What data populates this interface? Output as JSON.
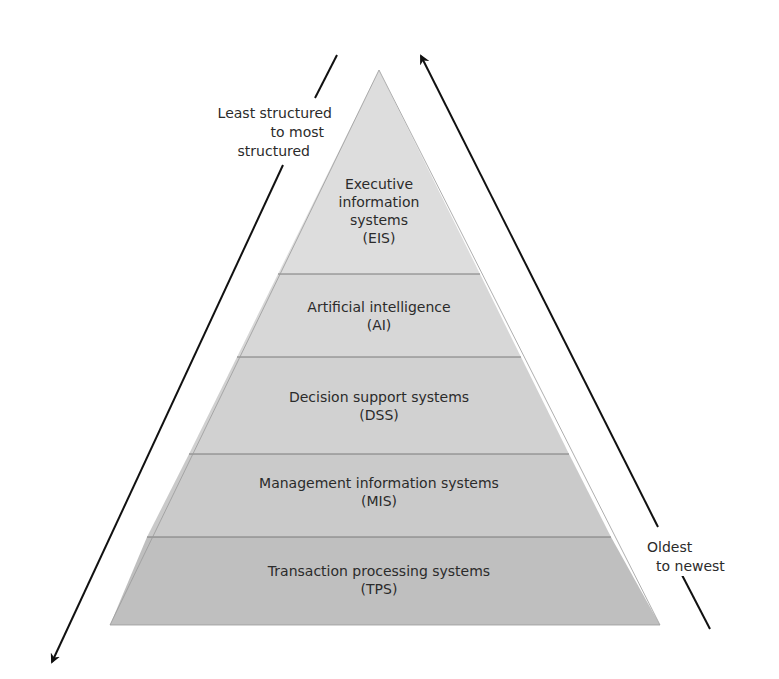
{
  "diagram": {
    "type": "pyramid",
    "layers": [
      {
        "id": "eis",
        "line1": "Executive",
        "line2": "information",
        "line3": "systems",
        "abbr": "(EIS)",
        "fill": "#dcdcdc"
      },
      {
        "id": "ai",
        "line1": "Artificial intelligence",
        "abbr": "(AI)",
        "fill": "#d6d6d6"
      },
      {
        "id": "dss",
        "line1": "Decision support systems",
        "abbr": "(DSS)",
        "fill": "#d0d0d0"
      },
      {
        "id": "mis",
        "line1": "Management information systems",
        "abbr": "(MIS)",
        "fill": "#c9c9c9"
      },
      {
        "id": "tps",
        "line1": "Transaction processing systems",
        "abbr": "(TPS)",
        "fill": "#bebebe"
      }
    ],
    "left_arrow": {
      "line1": "Least structured",
      "line2": "to most",
      "line3": "structured",
      "direction": "down"
    },
    "right_arrow": {
      "line1": "Oldest",
      "line2": "to newest",
      "direction": "up"
    }
  }
}
